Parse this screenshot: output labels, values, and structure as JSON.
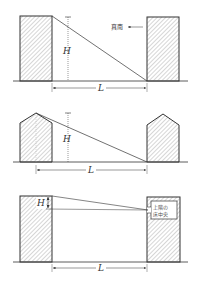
{
  "figures": [
    {
      "id": "fig1",
      "height_label": "H",
      "distance_label": "L",
      "direction_label": "真南"
    },
    {
      "id": "fig2",
      "height_label": "H",
      "distance_label": "L"
    },
    {
      "id": "fig3",
      "height_label": "H",
      "distance_label": "L",
      "box_label_line1": "上階の",
      "box_label_line2": "床中央"
    }
  ],
  "colors": {
    "line": "#333333",
    "hatch": "#888888",
    "background": "#ffffff"
  }
}
